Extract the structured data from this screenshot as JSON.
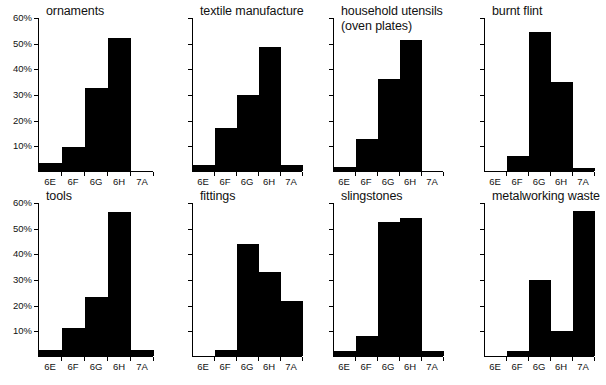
{
  "figure": {
    "name": "multi-panel-histogram-figure",
    "panel_count": 8,
    "columns": 4,
    "rows": 2,
    "bar_color": "#000000",
    "axis_color": "#000000",
    "background": "#ffffff"
  },
  "axes": {
    "categories": [
      "6E",
      "6F",
      "6G",
      "6H",
      "7A"
    ],
    "y_ticks": [
      10,
      20,
      30,
      40,
      50,
      60
    ],
    "y_tick_labels": [
      "10%",
      "20%",
      "30%",
      "40%",
      "50%",
      "60%"
    ],
    "ylim": [
      0,
      60
    ],
    "ylabel": "",
    "xlabel": "",
    "grid": false,
    "y_labels_shown_on_columns": [
      0
    ]
  },
  "chart_data": [
    {
      "type": "bar",
      "title": "ornaments",
      "title_lines": [
        "ornaments"
      ],
      "categories": [
        "6E",
        "6F",
        "6G",
        "6H",
        "7A"
      ],
      "values": [
        3,
        9.5,
        32.5,
        52,
        0
      ],
      "xlabel": "",
      "ylabel": "",
      "ylim": [
        0,
        60
      ],
      "yticks": [
        10,
        20,
        30,
        40,
        50,
        60
      ],
      "show_y_labels": true
    },
    {
      "type": "bar",
      "title": "textile manufacture",
      "title_lines": [
        "textile manufacture"
      ],
      "categories": [
        "6E",
        "6F",
        "6G",
        "6H",
        "7A"
      ],
      "values": [
        2.5,
        17,
        30,
        48.5,
        2.5
      ],
      "xlabel": "",
      "ylabel": "",
      "ylim": [
        0,
        60
      ],
      "yticks": [
        10,
        20,
        30,
        40,
        50,
        60
      ],
      "show_y_labels": false
    },
    {
      "type": "bar",
      "title": "household utensils (oven plates)",
      "title_lines": [
        "household utensils",
        "(oven plates)"
      ],
      "categories": [
        "6E",
        "6F",
        "6G",
        "6H",
        "7A"
      ],
      "values": [
        1.5,
        12.5,
        36,
        51.5,
        0
      ],
      "xlabel": "",
      "ylabel": "",
      "ylim": [
        0,
        60
      ],
      "yticks": [
        10,
        20,
        30,
        40,
        50,
        60
      ],
      "show_y_labels": false
    },
    {
      "type": "bar",
      "title": "burnt flint",
      "title_lines": [
        "burnt flint"
      ],
      "categories": [
        "6E",
        "6F",
        "6G",
        "6H",
        "7A"
      ],
      "values": [
        0,
        6,
        54.5,
        35,
        1
      ],
      "xlabel": "",
      "ylabel": "",
      "ylim": [
        0,
        60
      ],
      "yticks": [
        10,
        20,
        30,
        40,
        50,
        60
      ],
      "show_y_labels": false
    },
    {
      "type": "bar",
      "title": "tools",
      "title_lines": [
        "tools"
      ],
      "categories": [
        "6E",
        "6F",
        "6G",
        "6H",
        "7A"
      ],
      "values": [
        2.5,
        11,
        23,
        56.5,
        2.5
      ],
      "xlabel": "",
      "ylabel": "",
      "ylim": [
        0,
        60
      ],
      "yticks": [
        10,
        20,
        30,
        40,
        50,
        60
      ],
      "show_y_labels": true
    },
    {
      "type": "bar",
      "title": "fittings",
      "title_lines": [
        "fittings"
      ],
      "categories": [
        "6E",
        "6F",
        "6G",
        "6H",
        "7A"
      ],
      "values": [
        0,
        2.5,
        44,
        33,
        21.5
      ],
      "xlabel": "",
      "ylabel": "",
      "ylim": [
        0,
        60
      ],
      "yticks": [
        10,
        20,
        30,
        40,
        50,
        60
      ],
      "show_y_labels": false
    },
    {
      "type": "bar",
      "title": "slingstones",
      "title_lines": [
        "slingstones"
      ],
      "categories": [
        "6E",
        "6F",
        "6G",
        "6H",
        "7A"
      ],
      "values": [
        2,
        8,
        52.5,
        54,
        2
      ],
      "xlabel": "",
      "ylabel": "",
      "ylim": [
        0,
        60
      ],
      "yticks": [
        10,
        20,
        30,
        40,
        50,
        60
      ],
      "show_y_labels": false
    },
    {
      "type": "bar",
      "title": "metalworking waste",
      "title_lines": [
        "metalworking waste"
      ],
      "categories": [
        "6E",
        "6F",
        "6G",
        "6H",
        "7A"
      ],
      "values": [
        0,
        2,
        30,
        10,
        57
      ],
      "xlabel": "",
      "ylabel": "",
      "ylim": [
        0,
        60
      ],
      "yticks": [
        10,
        20,
        30,
        40,
        50,
        60
      ],
      "show_y_labels": false
    }
  ]
}
